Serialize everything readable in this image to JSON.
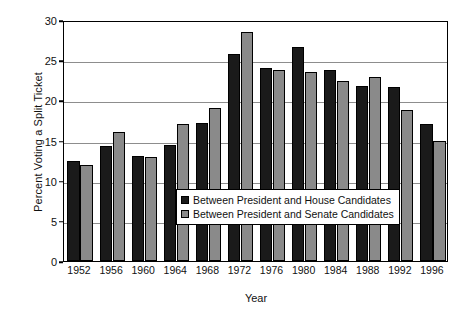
{
  "chart_data": {
    "type": "bar",
    "title": "",
    "xlabel": "Year",
    "ylabel": "Percent Voting a Split Ticket",
    "categories": [
      "1952",
      "1956",
      "1960",
      "1964",
      "1968",
      "1972",
      "1976",
      "1980",
      "1984",
      "1988",
      "1992",
      "1996"
    ],
    "series": [
      {
        "name": "Between President and House Candidates",
        "color": "#1a1a1a",
        "values": [
          12.5,
          14.3,
          13.1,
          14.5,
          17.2,
          25.8,
          24.0,
          26.7,
          23.8,
          21.8,
          21.7,
          17.0
        ]
      },
      {
        "name": "Between President and Senate Candidates",
        "color": "#8a8a8a",
        "values": [
          11.9,
          16.0,
          12.9,
          17.1,
          19.1,
          28.5,
          23.8,
          23.5,
          22.4,
          22.9,
          18.8,
          15.0
        ]
      }
    ],
    "ylim": [
      0,
      30
    ],
    "yticks": [
      0,
      5,
      10,
      15,
      20,
      25,
      30
    ],
    "ytick_labels": [
      "0",
      "5",
      "10",
      "15",
      "20",
      "25",
      "30"
    ],
    "grid": true,
    "grid_axis": "y",
    "legend_position": "center",
    "legend_entries": [
      "Between President and House Candidates",
      "Between President and Senate Candidates"
    ]
  }
}
